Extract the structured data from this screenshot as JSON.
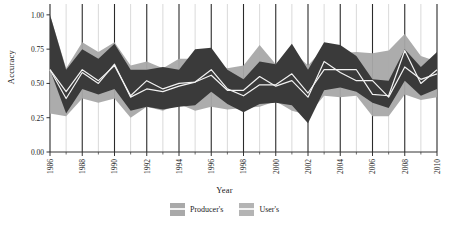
{
  "chart_data": {
    "type": "area",
    "title": "",
    "xlabel": "Year",
    "ylabel": "Accuracy",
    "ylim": [
      0.0,
      1.05
    ],
    "xlim": [
      1986,
      2010
    ],
    "yticks": [
      "0.00",
      "0.25",
      "0.50",
      "0.75",
      "1.00"
    ],
    "ytick_values": [
      0.0,
      0.25,
      0.5,
      0.75,
      1.0
    ],
    "xticks": [
      "1986",
      "1988",
      "1990",
      "1992",
      "1994",
      "1996",
      "1998",
      "2000",
      "2002",
      "2004",
      "2006",
      "2008",
      "2010"
    ],
    "xtick_values": [
      1986,
      1988,
      1990,
      1992,
      1994,
      1996,
      1998,
      2000,
      2002,
      2004,
      2006,
      2008,
      2010
    ],
    "grid": "vertical gridlines at every year; major dark lines on even years, light lines on odd years",
    "legend_position": "bottom-center",
    "x": [
      1986,
      1987,
      1988,
      1989,
      1990,
      1991,
      1992,
      1993,
      1994,
      1995,
      1996,
      1997,
      1998,
      1999,
      2000,
      2001,
      2002,
      2003,
      2004,
      2005,
      2006,
      2007,
      2008,
      2009,
      2010
    ],
    "series": [
      {
        "name": "Producer's",
        "color": "#3a3a3a",
        "line_color": "#f2f2f2",
        "mean": [
          0.6,
          0.44,
          0.6,
          0.52,
          0.63,
          0.41,
          0.52,
          0.46,
          0.5,
          0.51,
          0.6,
          0.46,
          0.41,
          0.49,
          0.49,
          0.57,
          0.43,
          0.6,
          0.6,
          0.6,
          0.42,
          0.41,
          0.74,
          0.5,
          0.6
        ],
        "lower": [
          0.6,
          0.28,
          0.46,
          0.42,
          0.46,
          0.3,
          0.33,
          0.31,
          0.33,
          0.34,
          0.44,
          0.35,
          0.29,
          0.35,
          0.36,
          0.34,
          0.21,
          0.45,
          0.47,
          0.44,
          0.36,
          0.32,
          0.52,
          0.41,
          0.46
        ],
        "upper": [
          1.0,
          0.6,
          0.75,
          0.68,
          0.79,
          0.6,
          0.6,
          0.62,
          0.6,
          0.75,
          0.76,
          0.6,
          0.53,
          0.66,
          0.64,
          0.79,
          0.6,
          0.8,
          0.78,
          0.7,
          0.53,
          0.52,
          0.75,
          0.62,
          0.73
        ]
      },
      {
        "name": "User's",
        "color": "#a8a8a8",
        "line_color": "#f2f2f2",
        "mean": [
          0.6,
          0.39,
          0.58,
          0.5,
          0.64,
          0.4,
          0.46,
          0.44,
          0.48,
          0.51,
          0.56,
          0.45,
          0.45,
          0.55,
          0.48,
          0.52,
          0.4,
          0.66,
          0.58,
          0.52,
          0.52,
          0.4,
          0.62,
          0.53,
          0.57
        ],
        "lower": [
          0.28,
          0.26,
          0.39,
          0.36,
          0.39,
          0.25,
          0.33,
          0.3,
          0.35,
          0.3,
          0.33,
          0.31,
          0.32,
          0.33,
          0.37,
          0.3,
          0.27,
          0.41,
          0.4,
          0.41,
          0.26,
          0.26,
          0.42,
          0.38,
          0.4
        ],
        "upper": [
          1.0,
          0.61,
          0.8,
          0.73,
          0.8,
          0.63,
          0.66,
          0.61,
          0.68,
          0.68,
          0.66,
          0.61,
          0.63,
          0.78,
          0.64,
          0.74,
          0.63,
          0.76,
          0.72,
          0.73,
          0.72,
          0.74,
          0.86,
          0.7,
          0.66
        ]
      }
    ]
  },
  "axes": {
    "y_title": "Accuracy",
    "x_title": "Year"
  },
  "legend": {
    "items": [
      {
        "label": "Producer's",
        "color": "#a9a9a9"
      },
      {
        "label": "User's",
        "color": "#b4b4b4"
      }
    ]
  },
  "style": {
    "background": "#ffffff",
    "producers_band": "#3a3a3a",
    "users_band": "#a8a8a8",
    "mean_line": "#f2f2f2",
    "major_gridline": "#2b2b2b",
    "minor_gridline": "#c9c9c9",
    "axis_color": "#333333"
  }
}
